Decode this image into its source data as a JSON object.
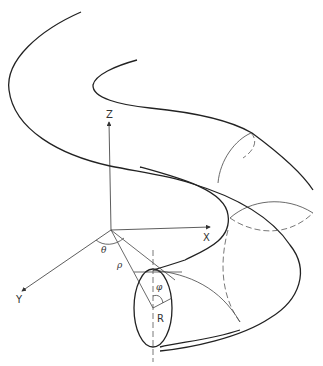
{
  "diagram": {
    "axes": {
      "x_label": "X",
      "y_label": "Y",
      "z_label": "Z"
    },
    "symbols": {
      "theta": "θ",
      "rho": "ρ",
      "phi": "φ",
      "radius": "R"
    }
  }
}
